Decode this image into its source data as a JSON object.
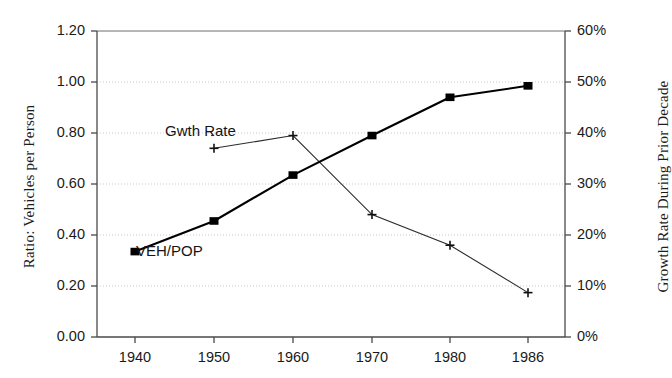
{
  "chart_data": {
    "type": "line",
    "title": "",
    "xlabel": "",
    "categories": [
      "1940",
      "1950",
      "1960",
      "1970",
      "1980",
      "1986"
    ],
    "x": [
      1940,
      1950,
      1960,
      1970,
      1980,
      1986
    ],
    "grid": true,
    "legend_position": "inline-annotations",
    "series": [
      {
        "name": "VEH/POP",
        "axis": "left",
        "marker": "filled-square",
        "values": [
          0.335,
          0.455,
          0.635,
          0.79,
          0.94,
          0.985
        ]
      },
      {
        "name": "Gwth Rate",
        "axis": "right",
        "marker": "plus",
        "values": [
          null,
          37,
          39.5,
          24,
          18,
          8.7
        ]
      }
    ],
    "left_axis": {
      "label": "Ratio: Vehicles per Person",
      "ylim": [
        0.0,
        1.2
      ],
      "ticks": [
        0.0,
        0.2,
        0.4,
        0.6,
        0.8,
        1.0,
        1.2
      ],
      "tick_labels": [
        "0.00",
        "0.20",
        "0.40",
        "0.60",
        "0.80",
        "1.00",
        "1.20"
      ]
    },
    "right_axis": {
      "label": "Growth Rate During Prior Decade",
      "ylim": [
        0,
        60
      ],
      "ticks": [
        0,
        10,
        20,
        30,
        40,
        50,
        60
      ],
      "tick_labels": [
        "0%",
        "10%",
        "20%",
        "30%",
        "40%",
        "50%",
        "60%"
      ]
    },
    "x_axis": {
      "tick_labels": [
        "1940",
        "1950",
        "1960",
        "1970",
        "1980",
        "1986"
      ]
    },
    "annotations": [
      {
        "text": "Gwth Rate",
        "series": "Gwth Rate"
      },
      {
        "text": "VEH/POP",
        "series": "VEH/POP"
      }
    ],
    "colors": {
      "series_veh_pop": "#000000",
      "series_gwth_rate": "#2a2a2a",
      "grid": "#c9c9c9",
      "axis": "#555555",
      "background": "#ffffff"
    }
  }
}
